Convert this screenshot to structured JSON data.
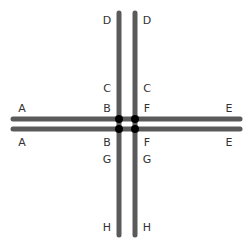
{
  "diagram": {
    "title": "",
    "colors": {
      "line": "#5a5a5a",
      "node": "#000000",
      "label": "#333333",
      "background": "#ffffff"
    },
    "lines": [
      {
        "id": "vertical-left",
        "x1": 119,
        "y1": 13,
        "x2": 119,
        "y2": 235
      },
      {
        "id": "vertical-right",
        "x1": 135,
        "y1": 13,
        "x2": 135,
        "y2": 235
      },
      {
        "id": "horizontal-top",
        "x1": 13,
        "y1": 119,
        "x2": 240,
        "y2": 119
      },
      {
        "id": "horizontal-bottom",
        "x1": 13,
        "y1": 129,
        "x2": 240,
        "y2": 129
      }
    ],
    "nodes": [
      {
        "id": "node-top-left",
        "x": 119,
        "y": 119
      },
      {
        "id": "node-top-right",
        "x": 135,
        "y": 119
      },
      {
        "id": "node-bottom-left",
        "x": 119,
        "y": 129
      },
      {
        "id": "node-bottom-right",
        "x": 135,
        "y": 129
      }
    ],
    "labels": [
      {
        "text": "D",
        "x": 107,
        "y": 24
      },
      {
        "text": "D",
        "x": 147,
        "y": 24
      },
      {
        "text": "C",
        "x": 107,
        "y": 92
      },
      {
        "text": "C",
        "x": 147,
        "y": 92
      },
      {
        "text": "A",
        "x": 22,
        "y": 112
      },
      {
        "text": "B",
        "x": 107,
        "y": 112
      },
      {
        "text": "F",
        "x": 147,
        "y": 112
      },
      {
        "text": "E",
        "x": 229,
        "y": 112
      },
      {
        "text": "A",
        "x": 22,
        "y": 146
      },
      {
        "text": "B",
        "x": 107,
        "y": 146
      },
      {
        "text": "F",
        "x": 147,
        "y": 146
      },
      {
        "text": "E",
        "x": 229,
        "y": 146
      },
      {
        "text": "G",
        "x": 107,
        "y": 163
      },
      {
        "text": "G",
        "x": 147,
        "y": 163
      },
      {
        "text": "H",
        "x": 107,
        "y": 231
      },
      {
        "text": "H",
        "x": 147,
        "y": 231
      }
    ]
  }
}
